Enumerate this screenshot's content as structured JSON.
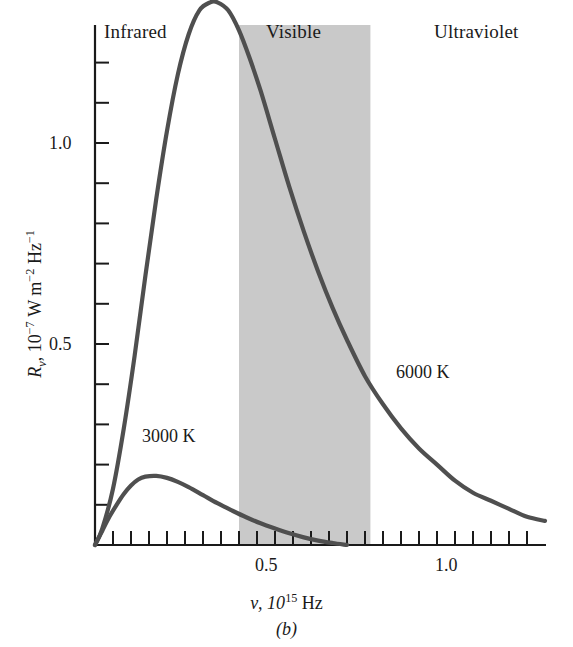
{
  "figure": {
    "caption": "(b)",
    "background_color": "#ffffff",
    "curve_color": "#4f4f4f",
    "axis_color": "#1a1a1a",
    "visible_band_color": "#c9c9c9"
  },
  "axes": {
    "x": {
      "title_prefix": "ν, 10",
      "title_exponent": "15",
      "title_suffix": " Hz",
      "title_full": "ν, 10¹⁵ Hz",
      "labeled_ticks": [
        "0.5",
        "1.0"
      ],
      "labeled_tick_values": [
        0.5,
        1.0
      ],
      "range": [
        0,
        1.25
      ],
      "minor_tick_step": 0.05
    },
    "y": {
      "title_symbol": "R",
      "title_subscript": "ν",
      "title_rest": ", 10",
      "title_exponent": "−7",
      "title_units_a": " W m",
      "title_units_exp_a": "−2",
      "title_units_b": " Hz",
      "title_units_exp_b": "−1",
      "title_full": "Rν, 10⁻⁷ W m⁻² Hz⁻¹",
      "labeled_ticks": [
        "0.5",
        "1.0"
      ],
      "labeled_tick_values": [
        0.5,
        1.0
      ],
      "range": [
        0,
        1.4
      ],
      "minor_tick_step": 0.1
    }
  },
  "regions": [
    {
      "name": "infrared",
      "label": "Infrared",
      "shaded": false
    },
    {
      "name": "visible",
      "label": "Visible",
      "shaded": true,
      "x_start": 0.4,
      "x_end": 0.765
    },
    {
      "name": "ultraviolet",
      "label": "Ultraviolet",
      "shaded": false
    }
  ],
  "curve_labels": [
    {
      "name": "curve-label-3000k",
      "label": "3000 K"
    },
    {
      "name": "curve-label-6000k",
      "label": "6000 K"
    }
  ],
  "chart_data": {
    "type": "line",
    "title": "",
    "xlabel": "ν, 10¹⁵ Hz",
    "ylabel": "Rν, 10⁻⁷ W m⁻² Hz⁻¹",
    "xlim": [
      0,
      1.25
    ],
    "ylim": [
      0,
      1.4
    ],
    "grid": false,
    "legend": "inline-annotations",
    "shaded_regions": [
      {
        "label": "Visible",
        "x_start": 0.4,
        "x_end": 0.765,
        "color": "#c9c9c9"
      }
    ],
    "annotations": [
      {
        "text": "Infrared",
        "x": 0.12,
        "y": 1.36
      },
      {
        "text": "Visible",
        "x": 0.53,
        "y": 1.36
      },
      {
        "text": "Ultraviolet",
        "x": 1.02,
        "y": 1.36
      },
      {
        "text": "3000 K",
        "x": 0.24,
        "y": 0.3
      },
      {
        "text": "6000 K",
        "x": 0.88,
        "y": 0.47
      }
    ],
    "series": [
      {
        "name": "6000 K",
        "temperature_K": 6000,
        "peak": {
          "x": 0.34,
          "y": 1.35
        },
        "x": [
          0.0,
          0.02,
          0.05,
          0.08,
          0.11,
          0.14,
          0.17,
          0.2,
          0.23,
          0.26,
          0.29,
          0.32,
          0.34,
          0.37,
          0.4,
          0.43,
          0.46,
          0.5,
          0.54,
          0.58,
          0.62,
          0.66,
          0.7,
          0.75,
          0.8,
          0.85,
          0.9,
          0.95,
          1.0,
          1.05,
          1.1,
          1.15,
          1.2,
          1.25
        ],
        "y": [
          0.0,
          0.04,
          0.14,
          0.29,
          0.47,
          0.67,
          0.86,
          1.03,
          1.17,
          1.27,
          1.33,
          1.35,
          1.35,
          1.33,
          1.28,
          1.21,
          1.13,
          1.01,
          0.89,
          0.78,
          0.68,
          0.59,
          0.51,
          0.42,
          0.35,
          0.29,
          0.24,
          0.2,
          0.16,
          0.13,
          0.11,
          0.09,
          0.07,
          0.06
        ]
      },
      {
        "name": "3000 K",
        "temperature_K": 3000,
        "peak": {
          "x": 0.17,
          "y": 0.17
        },
        "x": [
          0.0,
          0.02,
          0.04,
          0.06,
          0.08,
          0.1,
          0.12,
          0.14,
          0.17,
          0.2,
          0.23,
          0.26,
          0.3,
          0.34,
          0.38,
          0.42,
          0.46,
          0.5,
          0.54,
          0.58,
          0.62,
          0.66,
          0.7
        ],
        "y": [
          0.0,
          0.035,
          0.07,
          0.1,
          0.127,
          0.148,
          0.163,
          0.17,
          0.172,
          0.167,
          0.157,
          0.144,
          0.124,
          0.104,
          0.086,
          0.069,
          0.054,
          0.041,
          0.029,
          0.019,
          0.011,
          0.005,
          0.0
        ]
      }
    ]
  }
}
